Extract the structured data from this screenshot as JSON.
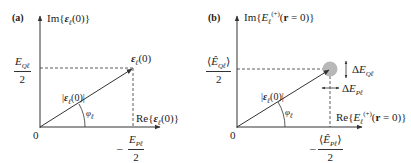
{
  "figure": {
    "panel_a": {
      "label": "(a)",
      "y_axis_label": "Im{𝓔ℓ(0)}",
      "x_axis_label": "Re{𝓔ℓ(0)}",
      "origin_label": "0",
      "vector_label": "𝓔ℓ(0)",
      "magnitude_label": "|𝓔ℓ(0)|",
      "angle_label": "φℓ",
      "y_tick": {
        "numerator": "E_Qℓ",
        "denominator": "2"
      },
      "x_tick": {
        "numerator": "E_Pℓ",
        "denominator": "2"
      }
    },
    "panel_b": {
      "label": "(b)",
      "y_axis_label": "Im{Eℓ(+)(r = 0)}",
      "x_axis_label": "Re{Eℓ(+)(r = 0)}",
      "origin_label": "0",
      "magnitude_label": "|𝓔ℓ(0)|",
      "angle_label": "φℓ",
      "y_tick": {
        "numerator": "⟨ÊQℓ⟩",
        "denominator": "2"
      },
      "x_tick": {
        "numerator": "⟨ÊPℓ⟩",
        "denominator": "2"
      },
      "uncertainty_q": "ΔE_Qℓ",
      "uncertainty_p": "ΔE_Pℓ"
    },
    "colors": {
      "line": "#333333",
      "uncertainty_disk": "#b8b8b8"
    }
  }
}
